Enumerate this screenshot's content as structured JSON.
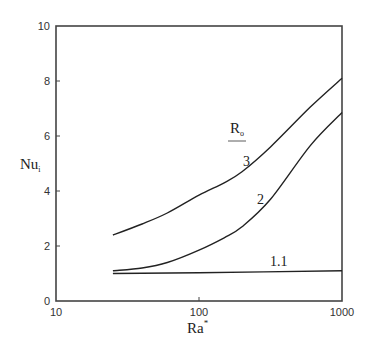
{
  "chart_data": {
    "type": "line",
    "title": "",
    "xlabel": "Ra",
    "xlabel_superscript": "*",
    "ylabel": "Nu",
    "ylabel_subscript": "i",
    "xscale": "log",
    "xlim": [
      10,
      1000
    ],
    "ylim": [
      0,
      10
    ],
    "grid": false,
    "x_ticks": [
      10,
      100,
      1000
    ],
    "x_tick_labels": [
      "10",
      "100",
      "1000"
    ],
    "y_ticks": [
      0,
      2,
      4,
      6,
      8,
      10
    ],
    "y_tick_labels": [
      "0",
      "2",
      "4",
      "6",
      "8",
      "10"
    ],
    "legend_title": "R",
    "legend_title_subscript": "o",
    "series": [
      {
        "name": "3",
        "x": [
          25,
          40,
          60,
          100,
          150,
          200,
          316,
          600,
          1000
        ],
        "y": [
          2.4,
          2.8,
          3.2,
          3.85,
          4.3,
          4.7,
          5.6,
          7.05,
          8.1
        ]
      },
      {
        "name": "2",
        "x": [
          25,
          40,
          60,
          100,
          150,
          200,
          316,
          600,
          1000
        ],
        "y": [
          1.1,
          1.2,
          1.4,
          1.85,
          2.3,
          2.7,
          3.7,
          5.65,
          6.85
        ]
      },
      {
        "name": "1.1",
        "x": [
          25,
          100,
          1000
        ],
        "y": [
          1.0,
          1.03,
          1.1
        ]
      }
    ],
    "annotations": [
      {
        "text": "3",
        "x": 240,
        "y": 300
      },
      {
        "text": "2",
        "x": 300,
        "y": 3.6
      },
      {
        "text": "1.1",
        "x": 420,
        "y": 1.4
      }
    ]
  }
}
